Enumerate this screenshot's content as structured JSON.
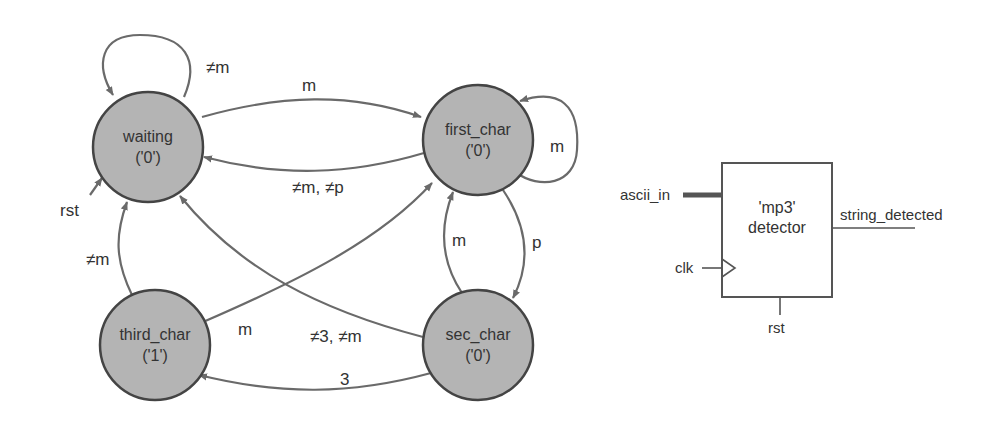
{
  "fsm": {
    "states": [
      {
        "id": "waiting",
        "name": "waiting",
        "output": "('0')"
      },
      {
        "id": "first_char",
        "name": "first_char",
        "output": "('0')"
      },
      {
        "id": "sec_char",
        "name": "sec_char",
        "output": "('0')"
      },
      {
        "id": "third_char",
        "name": "third_char",
        "output": "('1')"
      }
    ],
    "transitions": [
      {
        "from": "waiting",
        "to": "waiting",
        "label": "≠m"
      },
      {
        "from": "waiting",
        "to": "first_char",
        "label": "m"
      },
      {
        "from": "first_char",
        "to": "waiting",
        "label": "≠m, ≠p"
      },
      {
        "from": "first_char",
        "to": "first_char",
        "label": "m"
      },
      {
        "from": "first_char",
        "to": "sec_char",
        "label": "p"
      },
      {
        "from": "sec_char",
        "to": "first_char",
        "label": "m"
      },
      {
        "from": "sec_char",
        "to": "waiting",
        "label": "≠3, ≠m"
      },
      {
        "from": "sec_char",
        "to": "third_char",
        "label": "3"
      },
      {
        "from": "third_char",
        "to": "first_char",
        "label": "m"
      },
      {
        "from": "third_char",
        "to": "waiting",
        "label": "≠m"
      }
    ],
    "reset_label": "rst"
  },
  "block": {
    "title_line1": "'mp3'",
    "title_line2": "detector",
    "input_data": "ascii_in",
    "input_clock": "clk",
    "input_reset": "rst",
    "output": "string_detected"
  },
  "colors": {
    "state_fill": "#b4b4b4",
    "state_stroke": "#444444",
    "edge": "#6a6a6a"
  }
}
